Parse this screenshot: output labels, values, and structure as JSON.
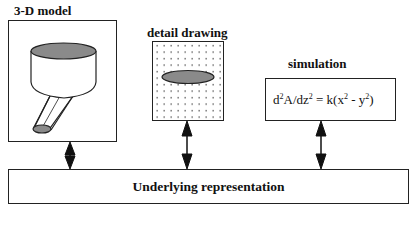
{
  "diagram": {
    "panels": [
      {
        "id": "model",
        "title": "3-D model",
        "content": "funnel-illustration"
      },
      {
        "id": "detail",
        "title": "detail drawing",
        "content": "dotted-grid-with-ellipse"
      },
      {
        "id": "simulation",
        "title": "simulation",
        "equation": {
          "lhs_a": "d",
          "lhs_a_sup": "2",
          "lhs_b": "A/dz",
          "lhs_b_sup": "2",
          "rhs_a": " = k(x",
          "rhs_a_sup": "2",
          "rhs_b": " - y",
          "rhs_b_sup": "2",
          "rhs_c": ")"
        }
      }
    ],
    "base": {
      "label": "Underlying representation"
    },
    "connectors": [
      {
        "from": "3-D model",
        "to": "Underlying representation",
        "type": "bidirectional-arrow"
      },
      {
        "from": "detail drawing",
        "to": "Underlying representation",
        "type": "bidirectional-arrow"
      },
      {
        "from": "simulation",
        "to": "Underlying representation",
        "type": "bidirectional-arrow"
      }
    ],
    "colors": {
      "stroke": "#222222",
      "fill_gray": "#8a8a8a",
      "background": "#ffffff"
    }
  }
}
